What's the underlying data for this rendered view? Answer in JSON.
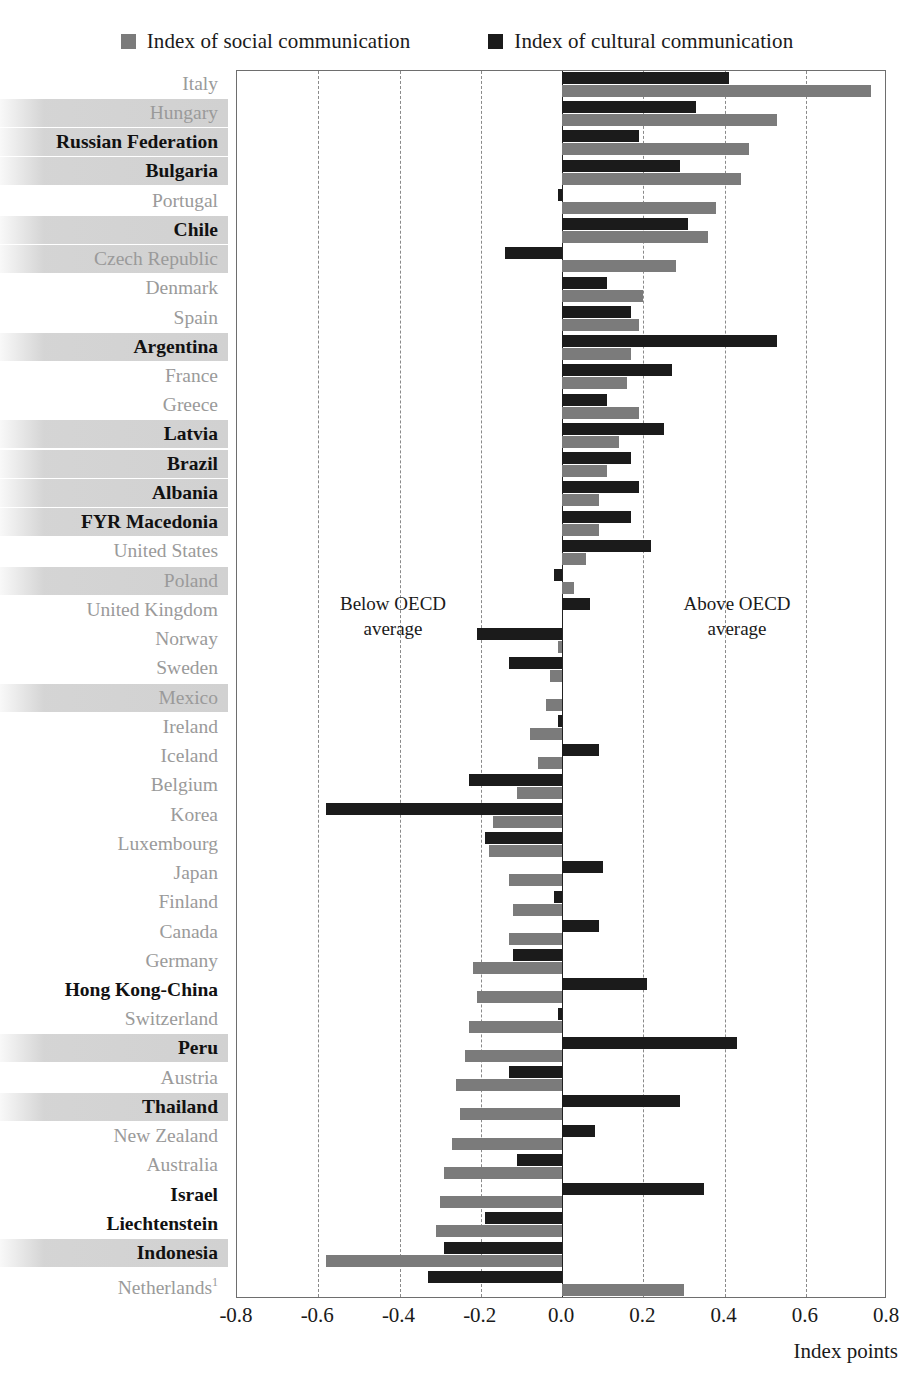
{
  "legend": {
    "items": [
      {
        "label": "Index of social communication",
        "color": "#7b7b7b",
        "key": "social"
      },
      {
        "label": "Index of cultural communication",
        "color": "#1b1b1b",
        "key": "cultural"
      }
    ]
  },
  "annotations": {
    "below": "Below OECD\naverage",
    "above": "Above OECD\naverage"
  },
  "axis": {
    "title": "Index points",
    "ticks": [
      "-0.8",
      "-0.6",
      "-0.4",
      "-0.2",
      "0.0",
      "0.2",
      "0.4",
      "0.6",
      "0.8"
    ]
  },
  "chart_data": {
    "type": "bar",
    "orientation": "horizontal",
    "title": "",
    "xlabel": "Index points",
    "ylabel": "",
    "xlim": [
      -0.8,
      0.8
    ],
    "grid": true,
    "gridlines": [
      -0.8,
      -0.6,
      -0.4,
      -0.2,
      0.0,
      0.2,
      0.4,
      0.6,
      0.8
    ],
    "legend_position": "top",
    "series": [
      {
        "name": "Index of cultural communication",
        "color": "#1b1b1b"
      },
      {
        "name": "Index of social communication",
        "color": "#7b7b7b"
      }
    ],
    "categories": [
      "Italy",
      "Hungary",
      "Russian Federation",
      "Bulgaria",
      "Portugal",
      "Chile",
      "Czech Republic",
      "Denmark",
      "Spain",
      "Argentina",
      "France",
      "Greece",
      "Latvia",
      "Brazil",
      "Albania",
      "FYR Macedonia",
      "United States",
      "Poland",
      "United Kingdom",
      "Norway",
      "Sweden",
      "Mexico",
      "Ireland",
      "Iceland",
      "Belgium",
      "Korea",
      "Luxembourg",
      "Japan",
      "Finland",
      "Canada",
      "Germany",
      "Hong Kong-China",
      "Switzerland",
      "Peru",
      "Austria",
      "Thailand",
      "New Zealand",
      "Australia",
      "Israel",
      "Liechtenstein",
      "Indonesia",
      "Netherlands"
    ],
    "rows": [
      {
        "label": "Italy",
        "group": "oecd",
        "band": false,
        "cultural": 0.41,
        "social": 0.76
      },
      {
        "label": "Hungary",
        "group": "oecd",
        "band": true,
        "cultural": 0.33,
        "social": 0.53
      },
      {
        "label": "Russian Federation",
        "group": "partner",
        "band": true,
        "cultural": 0.19,
        "social": 0.46
      },
      {
        "label": "Bulgaria",
        "group": "partner",
        "band": true,
        "cultural": 0.29,
        "social": 0.44
      },
      {
        "label": "Portugal",
        "group": "oecd",
        "band": false,
        "cultural": -0.01,
        "social": 0.38
      },
      {
        "label": "Chile",
        "group": "partner",
        "band": true,
        "cultural": 0.31,
        "social": 0.36
      },
      {
        "label": "Czech Republic",
        "group": "oecd",
        "band": true,
        "cultural": -0.14,
        "social": 0.28
      },
      {
        "label": "Denmark",
        "group": "oecd",
        "band": false,
        "cultural": 0.11,
        "social": 0.2
      },
      {
        "label": "Spain",
        "group": "oecd",
        "band": false,
        "cultural": 0.17,
        "social": 0.19
      },
      {
        "label": "Argentina",
        "group": "partner",
        "band": true,
        "cultural": 0.53,
        "social": 0.17
      },
      {
        "label": "France",
        "group": "oecd",
        "band": false,
        "cultural": 0.27,
        "social": 0.16
      },
      {
        "label": "Greece",
        "group": "oecd",
        "band": false,
        "cultural": 0.11,
        "social": 0.19
      },
      {
        "label": "Latvia",
        "group": "partner",
        "band": true,
        "cultural": 0.25,
        "social": 0.14
      },
      {
        "label": "Brazil",
        "group": "partner",
        "band": true,
        "cultural": 0.17,
        "social": 0.11
      },
      {
        "label": "Albania",
        "group": "partner",
        "band": true,
        "cultural": 0.19,
        "social": 0.09
      },
      {
        "label": "FYR Macedonia",
        "group": "partner",
        "band": true,
        "cultural": 0.17,
        "social": 0.09
      },
      {
        "label": "United States",
        "group": "oecd",
        "band": false,
        "cultural": 0.22,
        "social": 0.06
      },
      {
        "label": "Poland",
        "group": "oecd",
        "band": true,
        "cultural": -0.02,
        "social": 0.03
      },
      {
        "label": "United Kingdom",
        "group": "oecd",
        "band": false,
        "cultural": 0.07,
        "social": 0.0
      },
      {
        "label": "Norway",
        "group": "oecd",
        "band": false,
        "cultural": -0.21,
        "social": -0.01
      },
      {
        "label": "Sweden",
        "group": "oecd",
        "band": false,
        "cultural": -0.13,
        "social": -0.03
      },
      {
        "label": "Mexico",
        "group": "oecd",
        "band": true,
        "cultural": 0.0,
        "social": -0.04
      },
      {
        "label": "Ireland",
        "group": "oecd",
        "band": false,
        "cultural": -0.01,
        "social": -0.08
      },
      {
        "label": "Iceland",
        "group": "oecd",
        "band": false,
        "cultural": 0.09,
        "social": -0.06
      },
      {
        "label": "Belgium",
        "group": "oecd",
        "band": false,
        "cultural": -0.23,
        "social": -0.11
      },
      {
        "label": "Korea",
        "group": "oecd",
        "band": false,
        "cultural": -0.58,
        "social": -0.17
      },
      {
        "label": "Luxembourg",
        "group": "oecd",
        "band": false,
        "cultural": -0.19,
        "social": -0.18
      },
      {
        "label": "Japan",
        "group": "oecd",
        "band": false,
        "cultural": 0.1,
        "social": -0.13
      },
      {
        "label": "Finland",
        "group": "oecd",
        "band": false,
        "cultural": -0.02,
        "social": -0.12
      },
      {
        "label": "Canada",
        "group": "oecd",
        "band": false,
        "cultural": 0.09,
        "social": -0.13
      },
      {
        "label": "Germany",
        "group": "oecd",
        "band": false,
        "cultural": -0.12,
        "social": -0.22
      },
      {
        "label": "Hong Kong-China",
        "group": "partner",
        "band": false,
        "cultural": 0.21,
        "social": -0.21
      },
      {
        "label": "Switzerland",
        "group": "oecd",
        "band": false,
        "cultural": -0.01,
        "social": -0.23
      },
      {
        "label": "Peru",
        "group": "partner",
        "band": true,
        "cultural": 0.43,
        "social": -0.24
      },
      {
        "label": "Austria",
        "group": "oecd",
        "band": false,
        "cultural": -0.13,
        "social": -0.26
      },
      {
        "label": "Thailand",
        "group": "partner",
        "band": true,
        "cultural": 0.29,
        "social": -0.25
      },
      {
        "label": "New Zealand",
        "group": "oecd",
        "band": false,
        "cultural": 0.08,
        "social": -0.27
      },
      {
        "label": "Australia",
        "group": "oecd",
        "band": false,
        "cultural": -0.11,
        "social": -0.29
      },
      {
        "label": "Israel",
        "group": "partner",
        "band": false,
        "cultural": 0.35,
        "social": -0.3
      },
      {
        "label": "Liechtenstein",
        "group": "partner",
        "band": false,
        "cultural": -0.19,
        "social": -0.31
      },
      {
        "label": "Indonesia",
        "group": "partner",
        "band": true,
        "cultural": -0.29,
        "social": -0.58
      },
      {
        "label": "Netherlands",
        "group": "oecd",
        "band": false,
        "cultural": -0.33,
        "social": 0.3,
        "sup": "1"
      }
    ]
  }
}
